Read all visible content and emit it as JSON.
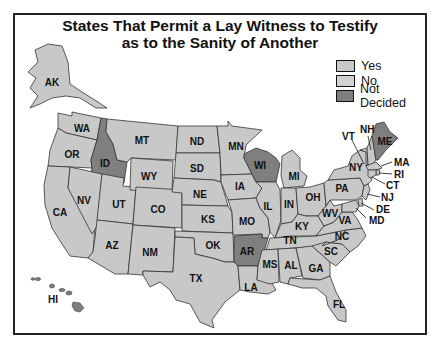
{
  "title": {
    "line1": "States That Permit a Lay Witness to Testify",
    "line2": "as to the Sanity of Another"
  },
  "legend": [
    {
      "key": "yes",
      "label": "Yes",
      "color": "#c9c9c9"
    },
    {
      "key": "no",
      "label": "No",
      "color": "#d2d2d2"
    },
    {
      "key": "not_decided",
      "label": "Not Decided",
      "color": "#7f7f7f"
    }
  ],
  "colors": {
    "state_default": "#c8c8c8",
    "state_not_decided": "#7f7f7f",
    "border": "#333333",
    "background": "#ffffff"
  },
  "states": {
    "AK": {
      "label": "AK",
      "status": "yes"
    },
    "HI": {
      "label": "HI",
      "status": "not_decided"
    },
    "WA": {
      "label": "WA",
      "status": "yes"
    },
    "OR": {
      "label": "OR",
      "status": "yes"
    },
    "CA": {
      "label": "CA",
      "status": "yes"
    },
    "ID": {
      "label": "ID",
      "status": "not_decided"
    },
    "NV": {
      "label": "NV",
      "status": "yes"
    },
    "UT": {
      "label": "UT",
      "status": "yes"
    },
    "AZ": {
      "label": "AZ",
      "status": "yes"
    },
    "MT": {
      "label": "MT",
      "status": "yes"
    },
    "WY": {
      "label": "WY",
      "status": "yes"
    },
    "CO": {
      "label": "CO",
      "status": "yes"
    },
    "NM": {
      "label": "NM",
      "status": "yes"
    },
    "ND": {
      "label": "ND",
      "status": "yes"
    },
    "SD": {
      "label": "SD",
      "status": "yes"
    },
    "NE": {
      "label": "NE",
      "status": "yes"
    },
    "KS": {
      "label": "KS",
      "status": "yes"
    },
    "OK": {
      "label": "OK",
      "status": "yes"
    },
    "TX": {
      "label": "TX",
      "status": "yes"
    },
    "MN": {
      "label": "MN",
      "status": "yes"
    },
    "IA": {
      "label": "IA",
      "status": "yes"
    },
    "MO": {
      "label": "MO",
      "status": "yes"
    },
    "AR": {
      "label": "AR",
      "status": "not_decided"
    },
    "LA": {
      "label": "LA",
      "status": "yes"
    },
    "WI": {
      "label": "WI",
      "status": "not_decided"
    },
    "IL": {
      "label": "IL",
      "status": "yes"
    },
    "MI": {
      "label": "MI",
      "status": "yes"
    },
    "IN": {
      "label": "IN",
      "status": "yes"
    },
    "OH": {
      "label": "OH",
      "status": "yes"
    },
    "KY": {
      "label": "KY",
      "status": "yes"
    },
    "TN": {
      "label": "TN",
      "status": "yes"
    },
    "MS": {
      "label": "MS",
      "status": "yes"
    },
    "AL": {
      "label": "AL",
      "status": "yes"
    },
    "GA": {
      "label": "GA",
      "status": "yes"
    },
    "FL": {
      "label": "FL",
      "status": "yes"
    },
    "SC": {
      "label": "SC",
      "status": "yes"
    },
    "NC": {
      "label": "NC",
      "status": "yes"
    },
    "VA": {
      "label": "VA",
      "status": "yes"
    },
    "WV": {
      "label": "WV",
      "status": "yes"
    },
    "PA": {
      "label": "PA",
      "status": "yes"
    },
    "NY": {
      "label": "NY",
      "status": "yes"
    },
    "VT": {
      "label": "VT",
      "status": "yes"
    },
    "NH": {
      "label": "NH",
      "status": "yes"
    },
    "ME": {
      "label": "ME",
      "status": "not_decided"
    },
    "MA": {
      "label": "MA",
      "status": "yes"
    },
    "RI": {
      "label": "RI",
      "status": "yes"
    },
    "CT": {
      "label": "CT",
      "status": "yes"
    },
    "NJ": {
      "label": "NJ",
      "status": "yes"
    },
    "DE": {
      "label": "DE",
      "status": "yes"
    },
    "MD": {
      "label": "MD",
      "status": "yes"
    }
  }
}
